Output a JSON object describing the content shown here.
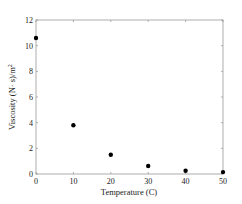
{
  "chart_data": {
    "type": "scatter",
    "title": "",
    "xlabel": "Temperature  (C)",
    "ylabel": "Viscosity  (N·s)/m²",
    "x": [
      0,
      10,
      20,
      30,
      40,
      50
    ],
    "values": [
      10.6,
      3.8,
      1.5,
      0.62,
      0.25,
      0.15
    ],
    "xlim": [
      0,
      50
    ],
    "ylim": [
      0,
      12
    ],
    "xticks": [
      "0",
      "10",
      "20",
      "30",
      "40",
      "50"
    ],
    "yticks": [
      "0",
      "2",
      "4",
      "6",
      "8",
      "10",
      "12"
    ],
    "grid": false,
    "legend": null,
    "marker_color": "#000000"
  }
}
